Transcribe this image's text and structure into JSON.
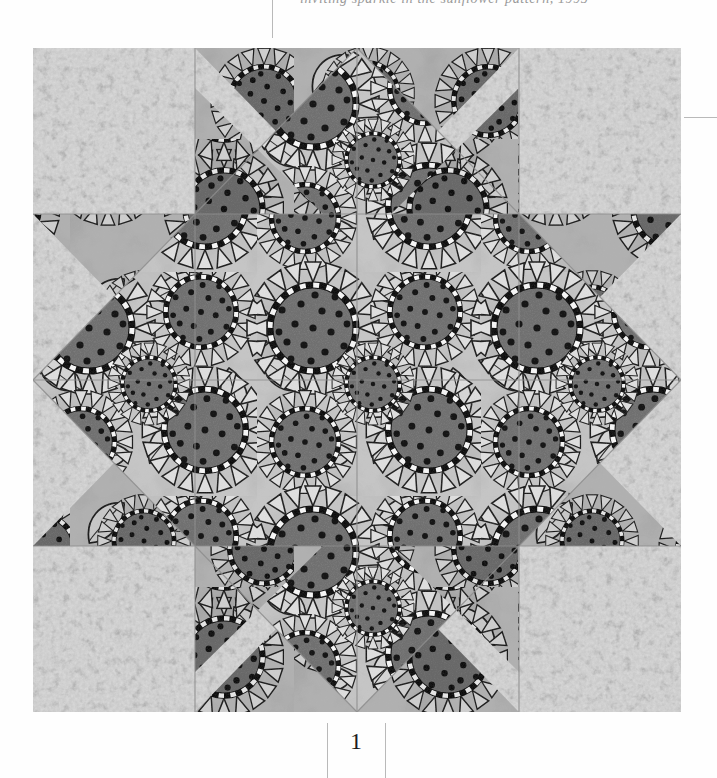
{
  "page": {
    "folio": "1",
    "header_text": "inviting sparkle in the sunflower pattern, 1995",
    "background_color": "#fefefe",
    "rule_color": "#b9b9b9"
  },
  "figure": {
    "name": "sunflower-lemoyne-star-quilt-block",
    "caption": "",
    "kind": "photograph",
    "palette": {
      "background_fabric_light": "#c9c9c9",
      "background_fabric_stipple": "#8e8e8e",
      "print_fabric_light": "#d2d2d2",
      "print_fabric_mid": "#a0a0a0",
      "print_fabric_shadow": "#7a7a7a",
      "flower_center_dark": "#6f6f6f",
      "flower_dot_black": "#141414",
      "outline_black": "#1a1a1a",
      "ring_white": "#f4f4f4",
      "seam_line": "#8a8a8a"
    },
    "geometry": {
      "grid": 4,
      "block_px": 648,
      "block_top_px": 48,
      "block_left_px": 33,
      "star_points": 8,
      "description": "Eight-pointed LeMoyne star pieced from sunflower print diamonds, set with light stipple-print corner squares and side triangles"
    },
    "motifs": {
      "flower_count_visible": 34,
      "flower_description": "sunflower heads with checkered black-and-white rings, dotted dark centers and pale pointed petals",
      "leaf_description": "broad outlined leaves between flower heads"
    }
  }
}
